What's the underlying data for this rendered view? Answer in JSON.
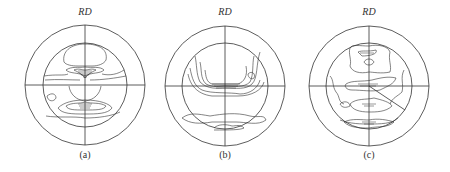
{
  "figure": {
    "panels": [
      {
        "id": "a",
        "axis_label": "RD",
        "caption": "(a)",
        "cx": 85,
        "cy": 85
      },
      {
        "id": "b",
        "axis_label": "RD",
        "caption": "(b)",
        "cx": 225,
        "cy": 86
      },
      {
        "id": "c",
        "axis_label": "RD",
        "caption": "(c)",
        "cx": 369,
        "cy": 86
      }
    ],
    "outer_radius": 60,
    "inner_radius": 42,
    "line_color": "#333333"
  }
}
